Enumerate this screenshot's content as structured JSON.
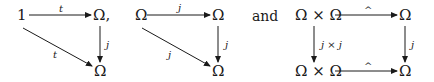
{
  "diagrams": [
    {
      "nodes": {
        "top_left": "1",
        "top_right": "Ω,",
        "bottom_right": "Ω"
      },
      "arrows": {
        "top": "t",
        "right": "j",
        "diagonal": "t"
      }
    },
    {
      "nodes": {
        "top_left": "Ω",
        "top_right": "Ω",
        "bottom_right": "Ω"
      },
      "arrows": {
        "top": "j",
        "right": "j",
        "diagonal": "j"
      }
    },
    {
      "nodes": {
        "top_left": "Ω × Ω",
        "top_right": "Ω",
        "bottom_left": "Ω × Ω",
        "bottom_right": "Ω"
      },
      "arrows": {
        "top": "^",
        "left": "j × j",
        "right": "j",
        "bottom": "^"
      }
    }
  ],
  "connector": "and",
  "colors": {
    "ink": "#1a1a1a",
    "background": "#ffffff"
  }
}
